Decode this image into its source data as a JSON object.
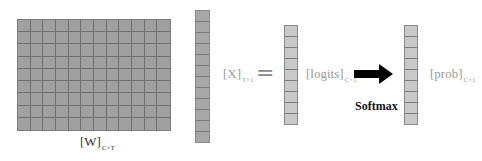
{
  "matrix_w": {
    "rows": 9,
    "cols": 12,
    "label": "[W]",
    "subscript": "C×T"
  },
  "vector_x": {
    "cells": 12,
    "label": "[X]",
    "subscript": "T×1"
  },
  "equals": "=",
  "vector_logits": {
    "cells": 9,
    "label": "[logits]",
    "subscript": "C×1"
  },
  "operation": {
    "label": "Softmax",
    "arrow": "right-arrow"
  },
  "vector_prob": {
    "cells": 9,
    "label": "[prob]",
    "subscript": "C×1"
  },
  "colors": {
    "matrix_fill": "#a0a0a0",
    "grid_line": "#6f6f6f",
    "vector_fill": "#c9c9c9",
    "arrow": "#000000",
    "label_text": "#9a9a9a"
  }
}
